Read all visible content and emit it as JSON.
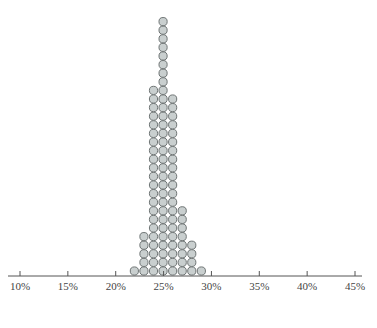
{
  "chart_data": {
    "type": "dot",
    "title": "",
    "xlabel": "",
    "ylabel": "",
    "x_ticks": [
      "10%",
      "15%",
      "20%",
      "25%",
      "30%",
      "35%",
      "40%",
      "45%"
    ],
    "xlim": [
      10,
      45
    ],
    "grid": false,
    "legend": null,
    "categories": [
      "22%",
      "23%",
      "24%",
      "25%",
      "26%",
      "27%",
      "28%",
      "29%"
    ],
    "x": [
      22,
      23,
      24,
      25,
      26,
      27,
      28,
      29
    ],
    "values": [
      1,
      5,
      22,
      30,
      21,
      8,
      4,
      1
    ],
    "total_dots": 92,
    "dot_fill": "#c9cfcf",
    "dot_stroke": "#6f7575"
  }
}
